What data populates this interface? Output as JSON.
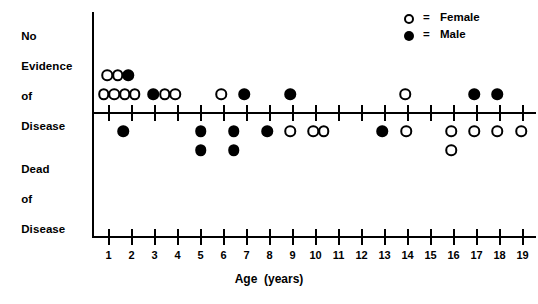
{
  "chart_data": {
    "type": "scatter",
    "title": "",
    "xlabel": "Age  (years)",
    "ylabel": "",
    "xlim": [
      0.3,
      19.7
    ],
    "grid": false,
    "legend_position": "top-right",
    "x_ticks": [
      1,
      2,
      3,
      4,
      5,
      6,
      7,
      8,
      9,
      10,
      11,
      12,
      13,
      14,
      15,
      16,
      17,
      18,
      19
    ],
    "x_tick_labels": [
      "1",
      "2",
      "3",
      "4",
      "5",
      "6",
      "7",
      "8",
      "9",
      "10",
      "11",
      "12",
      "13",
      "14",
      "15",
      "16",
      "17",
      "18",
      "19"
    ],
    "y_categories": [
      "No Evidence of Disease",
      "Dead of Disease"
    ],
    "legend": [
      {
        "key": "female",
        "marker": "open-circle",
        "label": "Female",
        "equals": "="
      },
      {
        "key": "male",
        "marker": "filled-circle",
        "label": "Male",
        "equals": "="
      }
    ],
    "series": [
      {
        "name": "Female",
        "marker": "open-circle",
        "color": "#ffffff",
        "edge_color": "#000000",
        "points": [
          {
            "group": "No Evidence of Disease",
            "age": 0.95,
            "stack": 2
          },
          {
            "group": "No Evidence of Disease",
            "age": 1.4,
            "stack": 2
          },
          {
            "group": "No Evidence of Disease",
            "age": 0.8,
            "stack": 1
          },
          {
            "group": "No Evidence of Disease",
            "age": 1.25,
            "stack": 1
          },
          {
            "group": "No Evidence of Disease",
            "age": 1.7,
            "stack": 1
          },
          {
            "group": "No Evidence of Disease",
            "age": 2.15,
            "stack": 1
          },
          {
            "group": "No Evidence of Disease",
            "age": 3.45,
            "stack": 1
          },
          {
            "group": "No Evidence of Disease",
            "age": 3.9,
            "stack": 1
          },
          {
            "group": "No Evidence of Disease",
            "age": 5.9,
            "stack": 1
          },
          {
            "group": "No Evidence of Disease",
            "age": 13.9,
            "stack": 1
          },
          {
            "group": "Dead of Disease",
            "age": 8.9,
            "stack": 1
          },
          {
            "group": "Dead of Disease",
            "age": 9.9,
            "stack": 1
          },
          {
            "group": "Dead of Disease",
            "age": 10.35,
            "stack": 1
          },
          {
            "group": "Dead of Disease",
            "age": 13.95,
            "stack": 1
          },
          {
            "group": "Dead of Disease",
            "age": 15.9,
            "stack": 1
          },
          {
            "group": "Dead of Disease",
            "age": 16.9,
            "stack": 1
          },
          {
            "group": "Dead of Disease",
            "age": 17.9,
            "stack": 1
          },
          {
            "group": "Dead of Disease",
            "age": 18.95,
            "stack": 1
          },
          {
            "group": "Dead of Disease",
            "age": 15.9,
            "stack": 2
          }
        ]
      },
      {
        "name": "Male",
        "marker": "filled-circle",
        "color": "#000000",
        "edge_color": "#000000",
        "points": [
          {
            "group": "No Evidence of Disease",
            "age": 1.85,
            "stack": 2
          },
          {
            "group": "No Evidence of Disease",
            "age": 2.95,
            "stack": 1
          },
          {
            "group": "No Evidence of Disease",
            "age": 6.9,
            "stack": 1
          },
          {
            "group": "No Evidence of Disease",
            "age": 8.9,
            "stack": 1
          },
          {
            "group": "No Evidence of Disease",
            "age": 16.9,
            "stack": 1
          },
          {
            "group": "No Evidence of Disease",
            "age": 17.9,
            "stack": 1
          },
          {
            "group": "Dead of Disease",
            "age": 1.65,
            "stack": 1
          },
          {
            "group": "Dead of Disease",
            "age": 5.0,
            "stack": 1
          },
          {
            "group": "Dead of Disease",
            "age": 6.45,
            "stack": 1
          },
          {
            "group": "Dead of Disease",
            "age": 7.9,
            "stack": 1
          },
          {
            "group": "Dead of Disease",
            "age": 12.9,
            "stack": 1
          },
          {
            "group": "Dead of Disease",
            "age": 5.0,
            "stack": 2
          },
          {
            "group": "Dead of Disease",
            "age": 6.45,
            "stack": 2
          }
        ]
      }
    ]
  },
  "axis_labels": {
    "no_evidence": [
      "No",
      "Evidence",
      "of",
      "Disease"
    ],
    "dead": [
      "Dead",
      "of",
      "Disease"
    ]
  },
  "axis_title": "Age  (years)"
}
